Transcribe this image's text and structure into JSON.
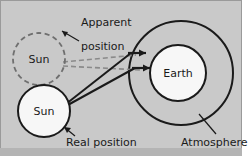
{
  "figure": {
    "topic": "Atmospheric refraction of sunlight",
    "background_color": "#c9c9c9",
    "border_color": "#9a9a9a"
  },
  "labels": {
    "apparent_position_line1": "Apparent",
    "apparent_position_line2": "position",
    "real_position": "Real position",
    "atmosphere": "Atmosphere",
    "sun_apparent": "Sun",
    "sun_real": "Sun",
    "earth": "Earth"
  },
  "objects": [
    {
      "name": "sun-apparent",
      "label": "Sun",
      "style": "dashed",
      "stroke": "#6f6f6f",
      "fill": "none",
      "cx": 39,
      "cy": 59,
      "r": 26
    },
    {
      "name": "sun-real",
      "label": "Sun",
      "style": "solid",
      "stroke": "#1a1a1a",
      "fill": "#f7f7f7",
      "cx": 44,
      "cy": 111,
      "r": 26
    },
    {
      "name": "earth",
      "label": "Earth",
      "style": "solid",
      "stroke": "#1a1a1a",
      "fill": "#f7f7f7",
      "cx": 178,
      "cy": 73,
      "r": 28
    },
    {
      "name": "atmosphere",
      "label": "Atmosphere",
      "style": "solid",
      "stroke": "#1a1a1a",
      "fill": "none",
      "cx": 181,
      "cy": 73,
      "r": 52
    }
  ],
  "rays": {
    "real_rays_color": "#1a1a1a",
    "apparent_rays_color": "#8a8a8a",
    "apparent_rays_style": "dashed",
    "count": 2,
    "description": "Light leaves the real Sun, bends at the atmosphere, and arrives horizontally at Earth; back-extrapolated dashed rays meet at the apparent Sun position."
  }
}
